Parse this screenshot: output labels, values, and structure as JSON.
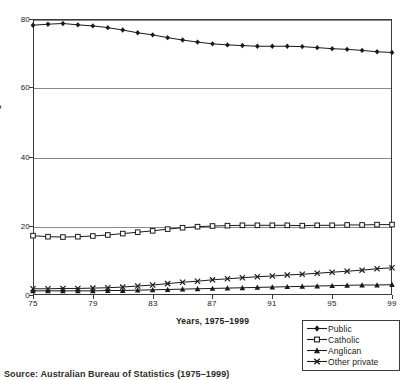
{
  "chart_data": {
    "type": "line",
    "title": "",
    "xlabel": "Years, 1975–1999",
    "ylabel": "Percentage",
    "x": [
      1975,
      1976,
      1977,
      1978,
      1979,
      1980,
      1981,
      1982,
      1983,
      1984,
      1985,
      1986,
      1987,
      1988,
      1989,
      1990,
      1991,
      1992,
      1993,
      1994,
      1995,
      1996,
      1997,
      1998,
      1999
    ],
    "x_tick_labels": [
      "75",
      "79",
      "83",
      "87",
      "91",
      "95",
      "99"
    ],
    "x_tick_values": [
      1975,
      1979,
      1983,
      1987,
      1991,
      1995,
      1999
    ],
    "y_tick_labels": [
      "0",
      "20",
      "40",
      "60",
      "80"
    ],
    "y_tick_values": [
      0,
      20,
      40,
      60,
      80
    ],
    "ylim": [
      0,
      80
    ],
    "xlim": [
      1975,
      1999
    ],
    "grid": "horizontal",
    "legend_position": "bottom-right outside",
    "series": [
      {
        "name": "Public",
        "marker": "diamond",
        "color": "#1a1a1a",
        "values": [
          78.2,
          78.5,
          78.7,
          78.3,
          78.0,
          77.5,
          76.8,
          76.0,
          75.4,
          74.6,
          73.9,
          73.3,
          72.8,
          72.5,
          72.3,
          72.1,
          72.1,
          72.1,
          72.0,
          71.7,
          71.4,
          71.2,
          70.9,
          70.5,
          70.3
        ]
      },
      {
        "name": "Catholic",
        "marker": "square",
        "color": "#1a1a1a",
        "values": [
          17.2,
          16.9,
          16.8,
          16.9,
          17.1,
          17.4,
          17.8,
          18.2,
          18.6,
          19.1,
          19.5,
          19.8,
          20.0,
          20.1,
          20.2,
          20.2,
          20.2,
          20.2,
          20.1,
          20.2,
          20.2,
          20.3,
          20.3,
          20.4,
          20.4
        ]
      },
      {
        "name": "Anglican",
        "marker": "triangle",
        "color": "#1a1a1a",
        "values": [
          1.2,
          1.2,
          1.2,
          1.2,
          1.2,
          1.3,
          1.3,
          1.4,
          1.5,
          1.6,
          1.7,
          1.8,
          1.9,
          2.0,
          2.1,
          2.2,
          2.3,
          2.4,
          2.5,
          2.6,
          2.7,
          2.8,
          2.9,
          2.9,
          3.0
        ]
      },
      {
        "name": "Other private",
        "marker": "cross",
        "color": "#1a1a1a",
        "values": [
          1.8,
          1.8,
          1.9,
          1.9,
          2.0,
          2.1,
          2.3,
          2.6,
          2.9,
          3.3,
          3.7,
          4.0,
          4.4,
          4.7,
          5.0,
          5.3,
          5.5,
          5.8,
          6.0,
          6.3,
          6.6,
          6.9,
          7.2,
          7.6,
          7.9
        ]
      }
    ]
  },
  "axes": {
    "y_title": "Percentage",
    "x_title": "Years, 1975–1999"
  },
  "legend": {
    "items": [
      {
        "label": "Public",
        "marker": "diamond"
      },
      {
        "label": "Catholic",
        "marker": "square"
      },
      {
        "label": "Anglican",
        "marker": "triangle"
      },
      {
        "label": "Other private",
        "marker": "cross"
      }
    ]
  },
  "caption": {
    "text": "Source: Australian Bureau of Statistics (1975–1999)"
  }
}
